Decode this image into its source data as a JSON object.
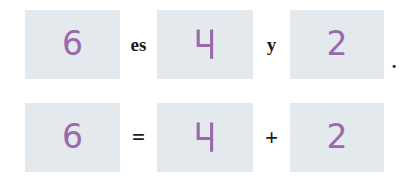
{
  "exercise": {
    "type": "fill-in-the-blank-arithmetic",
    "language": "es",
    "accent_color": "#9a69ab",
    "box_color": "#e3e9ec",
    "operator_color": "#1c1c1c",
    "rows": [
      {
        "id": "sentence-row",
        "boxes": [
          {
            "name": "total",
            "value": "6"
          },
          {
            "name": "addend-1",
            "value": "4"
          },
          {
            "name": "addend-2",
            "value": "2"
          }
        ],
        "operators": [
          {
            "name": "es",
            "label": "es"
          },
          {
            "name": "y",
            "label": "y"
          }
        ],
        "terminator": "."
      },
      {
        "id": "equation-row",
        "boxes": [
          {
            "name": "total",
            "value": "6"
          },
          {
            "name": "addend-1",
            "value": "4"
          },
          {
            "name": "addend-2",
            "value": "2"
          }
        ],
        "operators": [
          {
            "name": "equals",
            "label": "="
          },
          {
            "name": "plus",
            "label": "+"
          }
        ],
        "terminator": ""
      }
    ]
  }
}
